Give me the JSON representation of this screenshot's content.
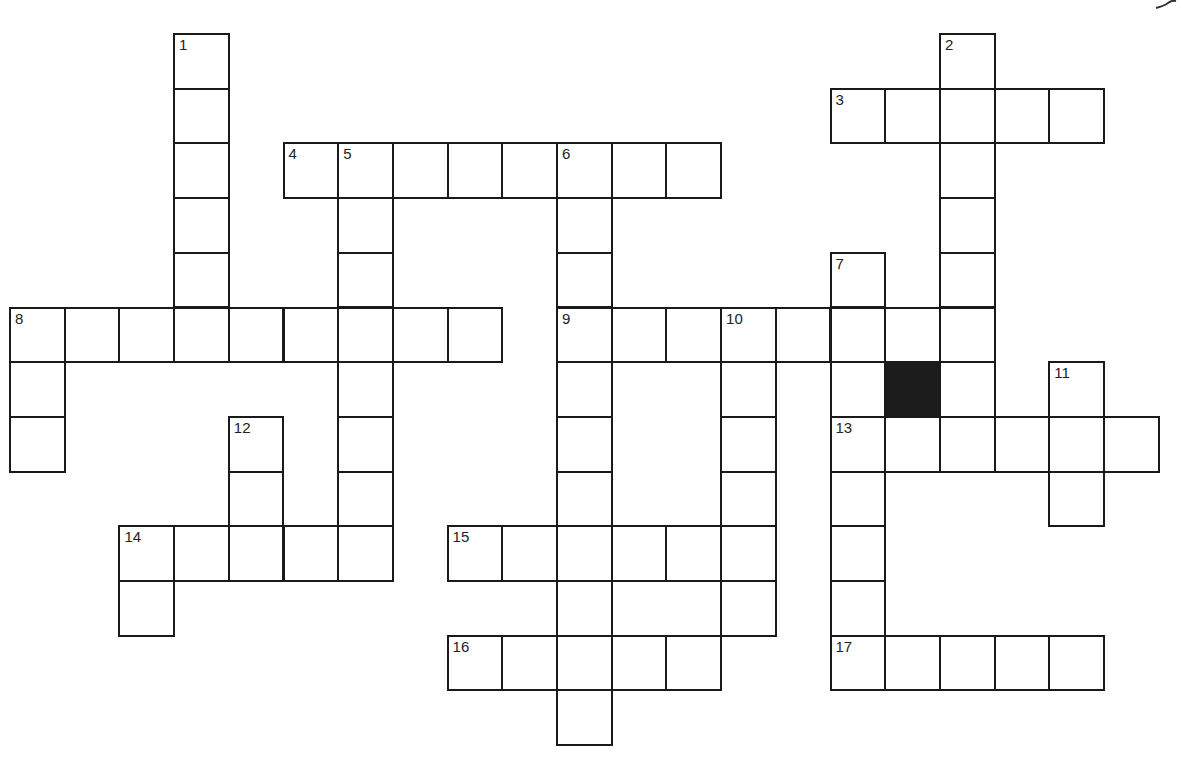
{
  "puzzle": {
    "type": "crossword",
    "cell_px": 54.7,
    "origin": {
      "x": 9,
      "y": 33
    },
    "colors": {
      "line": "#1a1a1a",
      "block": "#1c1c1c",
      "background": "#ffffff"
    },
    "entries": [
      {
        "number": "1",
        "direction": "down",
        "row": 0,
        "col": 3,
        "length": 6
      },
      {
        "number": "2",
        "direction": "down",
        "row": 0,
        "col": 17,
        "length": 8
      },
      {
        "number": "3",
        "direction": "across",
        "row": 1,
        "col": 15,
        "length": 5
      },
      {
        "number": "4",
        "direction": "across",
        "row": 2,
        "col": 5,
        "length": 8
      },
      {
        "number": "5",
        "direction": "down",
        "row": 2,
        "col": 6,
        "length": 8
      },
      {
        "number": "6",
        "direction": "down",
        "row": 2,
        "col": 10,
        "length": 11
      },
      {
        "number": "7",
        "direction": "down",
        "row": 4,
        "col": 15,
        "length": 8
      },
      {
        "number": "8",
        "direction": "across",
        "row": 5,
        "col": 0,
        "length": 9
      },
      {
        "number": "8",
        "direction": "down",
        "row": 5,
        "col": 0,
        "length": 3
      },
      {
        "number": "9",
        "direction": "across",
        "row": 5,
        "col": 10,
        "length": 8
      },
      {
        "number": "10",
        "direction": "down",
        "row": 5,
        "col": 13,
        "length": 6
      },
      {
        "number": "11",
        "direction": "down",
        "row": 6,
        "col": 19,
        "length": 3
      },
      {
        "number": "12",
        "direction": "down",
        "row": 7,
        "col": 4,
        "length": 3
      },
      {
        "number": "13",
        "direction": "across",
        "row": 7,
        "col": 15,
        "length": 6
      },
      {
        "number": "14",
        "direction": "across",
        "row": 9,
        "col": 2,
        "length": 5
      },
      {
        "number": "14",
        "direction": "down",
        "row": 9,
        "col": 2,
        "length": 2
      },
      {
        "number": "15",
        "direction": "across",
        "row": 9,
        "col": 8,
        "length": 6
      },
      {
        "number": "16",
        "direction": "across",
        "row": 11,
        "col": 8,
        "length": 5
      },
      {
        "number": "17",
        "direction": "across",
        "row": 11,
        "col": 15,
        "length": 5
      }
    ],
    "black_cells": [
      {
        "row": 6,
        "col": 16
      }
    ]
  }
}
